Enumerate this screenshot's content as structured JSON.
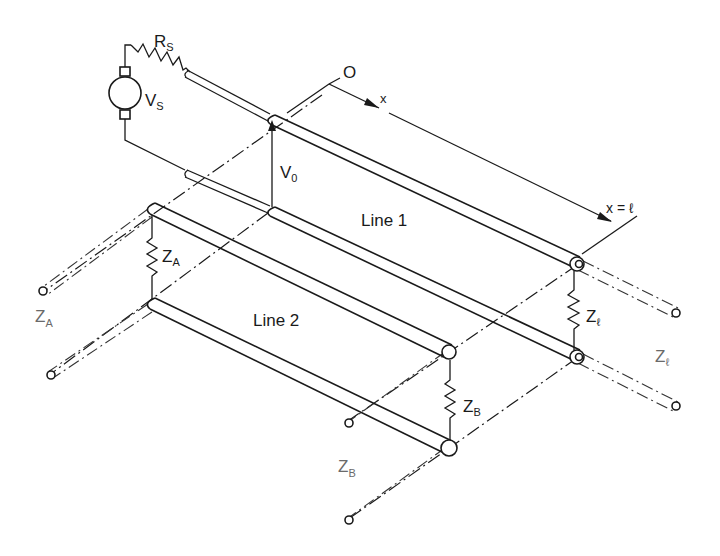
{
  "diagram": {
    "source": {
      "resistor_label": "R",
      "resistor_sub": "S",
      "voltage_label": "V",
      "voltage_sub": "S"
    },
    "input_voltage": {
      "label": "V",
      "sub": "0"
    },
    "axis": {
      "origin_label": "O",
      "x_label": "x",
      "end_label": "x = ℓ"
    },
    "lines": [
      {
        "label": "Line 1"
      },
      {
        "label": "Line 2"
      }
    ],
    "terminations": {
      "near_end": {
        "label": "Z",
        "sub": "A"
      },
      "near_end_line": {
        "label": "Z",
        "sub": "A"
      },
      "far_end_line1": {
        "label": "Z",
        "sub": "ℓ"
      },
      "far_end_line1_ref": {
        "label": "Z",
        "sub": "ℓ"
      },
      "far_end_line2": {
        "label": "Z",
        "sub": "B"
      },
      "far_end_line2_ref": {
        "label": "Z",
        "sub": "B"
      }
    },
    "colors": {
      "ink": "#1a1a1a",
      "background": "#ffffff"
    }
  }
}
